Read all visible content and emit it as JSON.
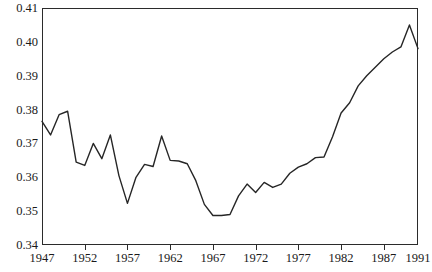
{
  "chart_data": {
    "type": "line",
    "title": "",
    "subtitle": "",
    "xlabel": "",
    "ylabel": "",
    "xlim": [
      1947,
      1991
    ],
    "ylim": [
      0.34,
      0.41
    ],
    "grid": false,
    "legend": null,
    "y_ticks": [
      0.34,
      0.35,
      0.36,
      0.37,
      0.38,
      0.39,
      0.4,
      0.41
    ],
    "y_tick_labels": [
      "0.34",
      "0.35",
      "0.36",
      "0.37",
      "0.38",
      "0.39",
      "0.40",
      "0.41"
    ],
    "x_ticks": [
      1947,
      1952,
      1957,
      1962,
      1967,
      1972,
      1977,
      1982,
      1987,
      1991
    ],
    "x_tick_labels": [
      "1947",
      "1952",
      "1957",
      "1962",
      "1967",
      "1972",
      "1977",
      "1982",
      "1987",
      "1991"
    ],
    "line_color": "#262626",
    "x": [
      1947,
      1948,
      1949,
      1950,
      1951,
      1952,
      1953,
      1954,
      1955,
      1956,
      1957,
      1958,
      1959,
      1960,
      1961,
      1962,
      1963,
      1964,
      1965,
      1966,
      1967,
      1968,
      1969,
      1970,
      1971,
      1972,
      1973,
      1974,
      1975,
      1976,
      1977,
      1978,
      1979,
      1980,
      1981,
      1982,
      1983,
      1984,
      1985,
      1986,
      1987,
      1988,
      1989,
      1990,
      1991
    ],
    "values": [
      0.3765,
      0.3725,
      0.3785,
      0.3795,
      0.3645,
      0.3635,
      0.37,
      0.3655,
      0.3725,
      0.3605,
      0.3523,
      0.36,
      0.3638,
      0.3632,
      0.3722,
      0.365,
      0.3648,
      0.364,
      0.359,
      0.352,
      0.3487,
      0.3487,
      0.349,
      0.3545,
      0.358,
      0.3555,
      0.3585,
      0.357,
      0.358,
      0.3612,
      0.363,
      0.364,
      0.3658,
      0.366,
      0.372,
      0.379,
      0.382,
      0.387,
      0.39,
      0.3925,
      0.395,
      0.397,
      0.3985,
      0.405,
      0.398
    ],
    "series": [
      {
        "name": "series-1",
        "values": [
          0.3765,
          0.3725,
          0.3785,
          0.3795,
          0.3645,
          0.3635,
          0.37,
          0.3655,
          0.3725,
          0.3605,
          0.3523,
          0.36,
          0.3638,
          0.3632,
          0.3722,
          0.365,
          0.3648,
          0.364,
          0.359,
          0.352,
          0.3487,
          0.3487,
          0.349,
          0.3545,
          0.358,
          0.3555,
          0.3585,
          0.357,
          0.358,
          0.3612,
          0.363,
          0.364,
          0.3658,
          0.366,
          0.372,
          0.379,
          0.382,
          0.387,
          0.39,
          0.3925,
          0.395,
          0.397,
          0.3985,
          0.405,
          0.398
        ]
      }
    ]
  }
}
